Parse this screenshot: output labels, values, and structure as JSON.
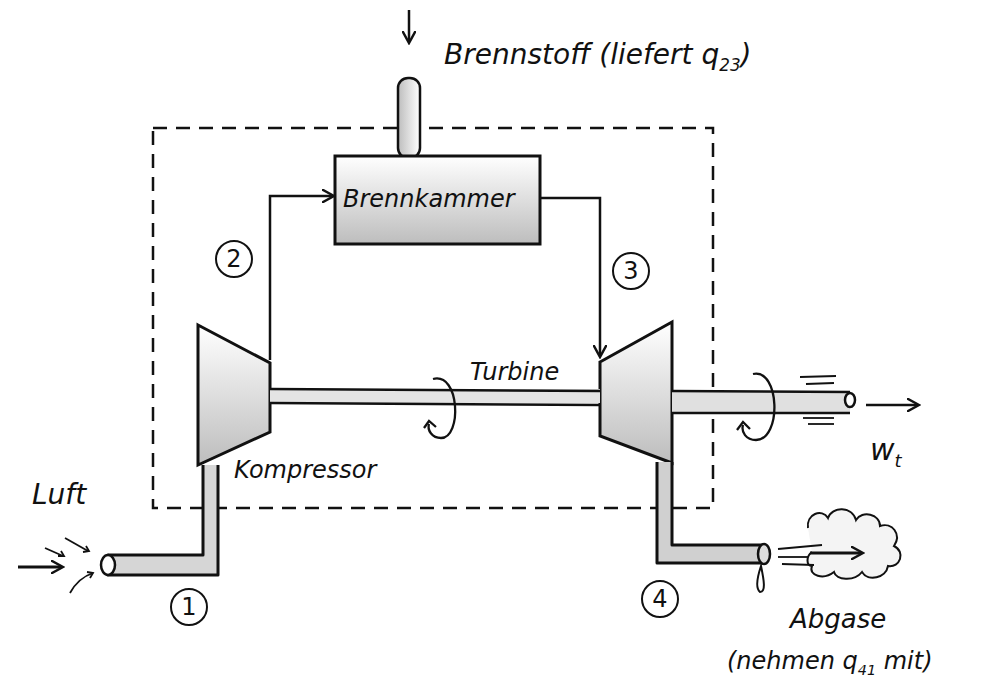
{
  "diagram": {
    "type": "gas turbine process schematic (hand-drawn)",
    "colors": {
      "ink": "#111111",
      "shade": "#c8c8c8",
      "background": "#ffffff"
    },
    "fuel": {
      "label": "Brennstoff",
      "note": "(liefert q",
      "note_sub": "23",
      "note_end": ")"
    },
    "combustion_chamber": {
      "label": "Brennkammer"
    },
    "compressor": {
      "label": "Kompressor"
    },
    "turbine": {
      "label": "Turbine"
    },
    "inlet": {
      "label": "Luft"
    },
    "exhaust": {
      "label": "Abgase",
      "note": "(nehmen q",
      "note_sub": "41",
      "note_end": " mit)"
    },
    "work_output": {
      "label": "w",
      "label_sub": "t"
    },
    "states": [
      {
        "id": "1",
        "label": "1"
      },
      {
        "id": "2",
        "label": "2"
      },
      {
        "id": "3",
        "label": "3"
      },
      {
        "id": "4",
        "label": "4"
      }
    ]
  }
}
